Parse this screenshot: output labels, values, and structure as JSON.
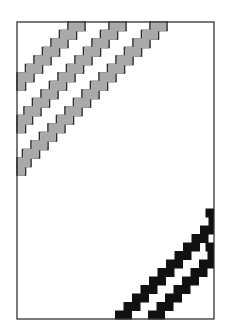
{
  "figure": {
    "width": 230,
    "height": 331,
    "background": "#ffffff",
    "frame": {
      "left": 17,
      "top": 22,
      "right": 214,
      "bottom": 319,
      "stroke": "#333333",
      "stroke_width": 1.3
    },
    "step": 8.5,
    "gray_bands": {
      "fill": "#a9a9a9",
      "stroke": "#2b2b2b",
      "items": [
        {
          "top_x": 68,
          "steps": 6
        },
        {
          "top_x": 109,
          "steps": 11
        },
        {
          "top_x": 150,
          "steps": 16
        }
      ]
    },
    "black_bands": {
      "fill": "#111111",
      "items": [
        {
          "bottom_x": 115,
          "steps": 12
        },
        {
          "bottom_x": 148,
          "steps": 8
        }
      ]
    }
  }
}
